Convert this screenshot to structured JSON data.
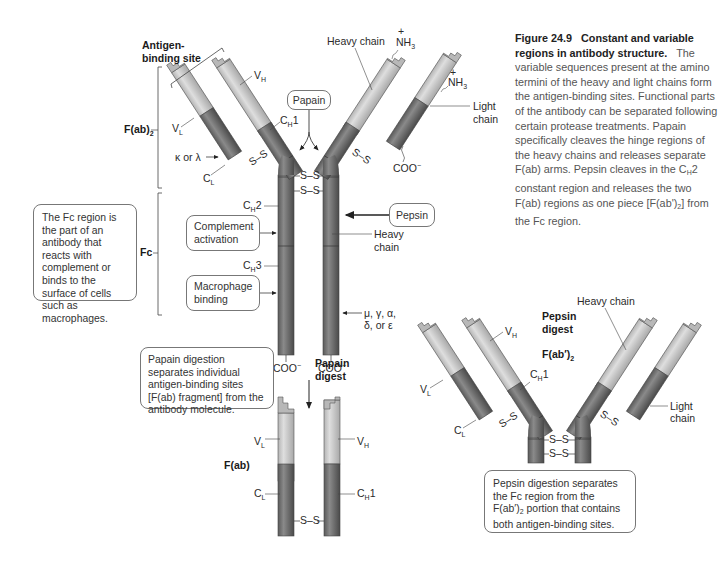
{
  "caption": {
    "title": "Figure 24.9",
    "title_rest": "Constant and variable regions in antibody structure.",
    "body": "The variable sequences present at the amino termini of the heavy and light chains form the antigen-binding sites. Functional parts of the antibody can be separated following certain protease treatments. Papain specifically cleaves the hinge regions of the heavy chains and releases separate F(ab) arms. Pepsin cleaves in the C",
    "body_sub": "H",
    "body_mid": "2 constant region and releases the two F(ab) regions as one piece [F(ab')",
    "body_sub2": "2",
    "body_end": "] from the Fc region."
  },
  "intact_antibody": {
    "antigen_binding_site": [
      "Antigen-",
      "binding site"
    ],
    "fab2_label": "F(ab)",
    "fab2_sub": "2",
    "fc_label": "Fc",
    "vl": "V",
    "vl_sub": "L",
    "vh": "V",
    "vh_sub": "H",
    "cl": "C",
    "cl_sub": "L",
    "ch1": "C",
    "ch1_sub": "H",
    "ch1_num": "1",
    "ch2": "C",
    "ch2_sub": "H",
    "ch2_num": "2",
    "ch3": "C",
    "ch3_sub": "H",
    "ch3_num": "3",
    "kappa_lambda": "κ or λ",
    "heavy_chain_top": "Heavy chain",
    "nh3": "NH",
    "nh3_sub": "3",
    "nh3_charge": "+",
    "light_chain": [
      "Light",
      "chain"
    ],
    "heavy_chain_side": [
      "Heavy",
      "chain"
    ],
    "coo": "COO",
    "coo_charge": "−",
    "isotypes": [
      "μ, γ, α,",
      "δ, or ε"
    ],
    "disulfide": "S–S",
    "papain_label": "Papain",
    "pepsin_label": "Pepsin",
    "complement_box": [
      "Complement",
      "activation"
    ],
    "macrophage_box": [
      "Macrophage",
      "binding"
    ],
    "fc_note": "The Fc region is the part of an antibody that reacts with complement or binds to the surface of cells such as macrophages."
  },
  "papain_digest": {
    "arrow_label": [
      "Papain",
      "digest"
    ],
    "note": "Papain digestion separates individual antigen-binding sites [F(ab) fragment] from the antibody molecule.",
    "fab_label": "F(ab)",
    "vl": "V",
    "vl_sub": "L",
    "vh": "V",
    "vh_sub": "H",
    "cl": "C",
    "cl_sub": "L",
    "ch1": "C",
    "ch1_sub": "H",
    "ch1_num": "1",
    "disulfide": "S–S"
  },
  "pepsin_digest": {
    "title": [
      "Pepsin",
      "digest"
    ],
    "fab2_label": "F(ab′)",
    "fab2_sub": "2",
    "heavy_chain": "Heavy chain",
    "light_chain": [
      "Light",
      "chain"
    ],
    "vl": "V",
    "vl_sub": "L",
    "vh": "V",
    "vh_sub": "H",
    "cl": "C",
    "cl_sub": "L",
    "ch1": "C",
    "ch1_sub": "H",
    "ch1_num": "1",
    "disulfide": "S–S",
    "note_a": "Pepsin digestion separates the Fc region from the F(ab′)",
    "note_sub": "2",
    "note_b": " portion that contains both antigen-binding sites."
  },
  "colors": {
    "variable_light": "#c9c9c9",
    "constant_dark": "#6f6f6f",
    "stroke": "#555555",
    "text": "#333333"
  }
}
